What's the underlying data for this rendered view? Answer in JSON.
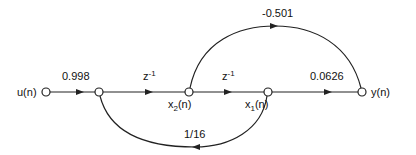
{
  "diagram": {
    "type": "signal-flow-graph",
    "nodes": [
      {
        "id": "u",
        "label": "u(n)",
        "x": 46,
        "y": 92
      },
      {
        "id": "a",
        "label": "",
        "x": 99,
        "y": 92
      },
      {
        "id": "x2",
        "label": "x2(n)",
        "x": 189,
        "y": 92
      },
      {
        "id": "x1",
        "label": "x1(n)",
        "x": 268,
        "y": 92
      },
      {
        "id": "y",
        "label": "y(n)",
        "x": 362,
        "y": 92
      }
    ],
    "edges": [
      {
        "from": "u",
        "to": "a",
        "gain": "0.998"
      },
      {
        "from": "a",
        "to": "x2",
        "gain": "z^-1"
      },
      {
        "from": "x2",
        "to": "x1",
        "gain": "z^-1"
      },
      {
        "from": "x1",
        "to": "y",
        "gain": "0.0626"
      },
      {
        "from": "x2",
        "to": "y",
        "gain": "-0.501"
      },
      {
        "from": "x1",
        "to": "a",
        "gain": "1/16"
      }
    ]
  },
  "labels": {
    "u": "u(n)",
    "y": "y(n)",
    "x2_main": "x",
    "x2_sub": "2",
    "x2_tail": "(n)",
    "x1_main": "x",
    "x1_sub": "1",
    "x1_tail": "(n)",
    "gain_in": "0.998",
    "delay1_main": "z",
    "delay1_sup": "-1",
    "delay2_main": "z",
    "delay2_sup": "-1",
    "gain_out": "0.0626",
    "gain_feedforward": "-0.501",
    "gain_feedback": "1/16"
  }
}
